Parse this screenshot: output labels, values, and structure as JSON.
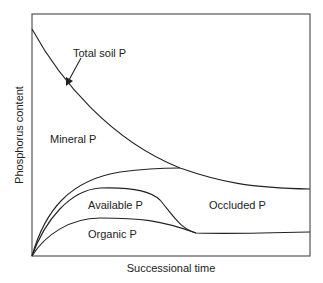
{
  "diagram": {
    "y_axis_label": "Phosphorus content",
    "x_axis_label": "Successional time",
    "labels": {
      "total_soil_p": "Total soil P",
      "mineral_p": "Mineral P",
      "available_p": "Available P",
      "organic_p": "Organic P",
      "occluded_p": "Occluded P"
    },
    "colors": {
      "line": "#222222",
      "frame": "#555555",
      "background": "#ffffff"
    }
  }
}
